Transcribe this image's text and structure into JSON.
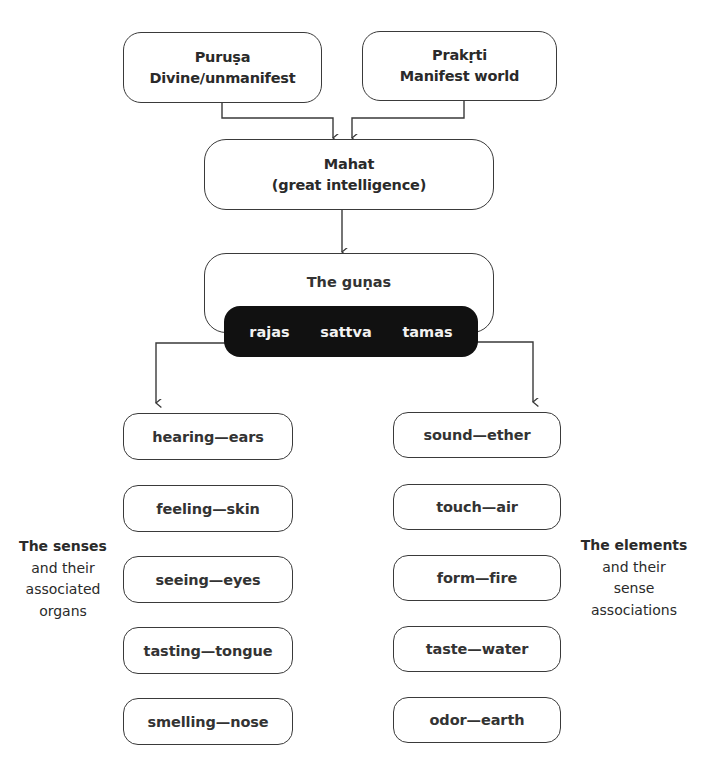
{
  "diagram": {
    "top_boxes": [
      {
        "title": "Puruṣa",
        "subtitle": "Divine/unmanifest"
      },
      {
        "title": "Prakṛti",
        "subtitle": "Manifest world"
      }
    ],
    "mahat": {
      "title": "Mahat",
      "subtitle": "(great intelligence)"
    },
    "gunas": {
      "title": "The guṇas",
      "items": [
        "rajas",
        "sattva",
        "tamas"
      ]
    },
    "senses": {
      "label": {
        "head": "The senses",
        "line2": "and their",
        "line3": "associated",
        "line4": "organs"
      },
      "items": [
        "hearing—ears",
        "feeling—skin",
        "seeing—eyes",
        "tasting—tongue",
        "smelling—nose"
      ]
    },
    "elements": {
      "label": {
        "head": "The elements",
        "line2": "and their",
        "line3": "sense",
        "line4": "associations"
      },
      "items": [
        "sound—ether",
        "touch—air",
        "form—fire",
        "taste—water",
        "odor—earth"
      ]
    },
    "colors": {
      "stroke": "#3a3a3a",
      "pill": "#111111",
      "pill_text": "#f2f2f2",
      "background": "#ffffff"
    }
  }
}
